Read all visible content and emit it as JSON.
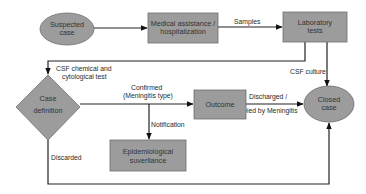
{
  "diagram": {
    "type": "flowchart",
    "colors": {
      "node_fill": "#9c9c9c",
      "node_stroke": "#6f6f6f",
      "line": "#222222",
      "text": "#333333",
      "background": "#ffffff"
    },
    "nodes": {
      "suspected_case": {
        "shape": "ellipse",
        "lines": [
          "Suspected",
          "case"
        ]
      },
      "medical_assistance": {
        "shape": "rectangle",
        "lines": [
          "Medical assistance /",
          "hospitalization"
        ]
      },
      "laboratory_tests": {
        "shape": "rectangle",
        "lines": [
          "Laboratory",
          "tests"
        ]
      },
      "case_definition": {
        "shape": "diamond",
        "lines": [
          "Case",
          "definition"
        ]
      },
      "outcome": {
        "shape": "rectangle",
        "lines": [
          "Outcome"
        ]
      },
      "epidemiological_surveillance": {
        "shape": "rectangle",
        "lines": [
          "Epidemiological",
          "suverllance"
        ]
      },
      "closed_case": {
        "shape": "ellipse",
        "lines": [
          "Closed",
          "case"
        ]
      }
    },
    "edges": {
      "suspected_to_medical": {
        "from": "Suspected case",
        "to": "Medical assistance / hospitalization",
        "label": ""
      },
      "samples": {
        "from": "Medical assistance / hospitalization",
        "to": "Laboratory tests",
        "label": "Samples"
      },
      "csf_chemical": {
        "from": "Laboratory tests",
        "to": "Case definition",
        "lines": [
          "CSF chemical and",
          "cytological test"
        ]
      },
      "csf_culture": {
        "from": "Laboratory tests",
        "to": "Closed case",
        "label": "CSF culture"
      },
      "confirmed": {
        "from": "Case definition",
        "to": "Outcome",
        "lines": [
          "Confirmed",
          "(Meningitis type)"
        ]
      },
      "notification": {
        "from": "Confirmed edge",
        "to": "Epidemiological surveillance",
        "label": "Notification"
      },
      "discharged": {
        "from": "Outcome",
        "to": "Closed case",
        "lines": [
          "Discharged /",
          "Died by Meningitis"
        ]
      },
      "discarded": {
        "from": "Case definition",
        "to": "Closed case",
        "label": "Discarded"
      }
    }
  }
}
